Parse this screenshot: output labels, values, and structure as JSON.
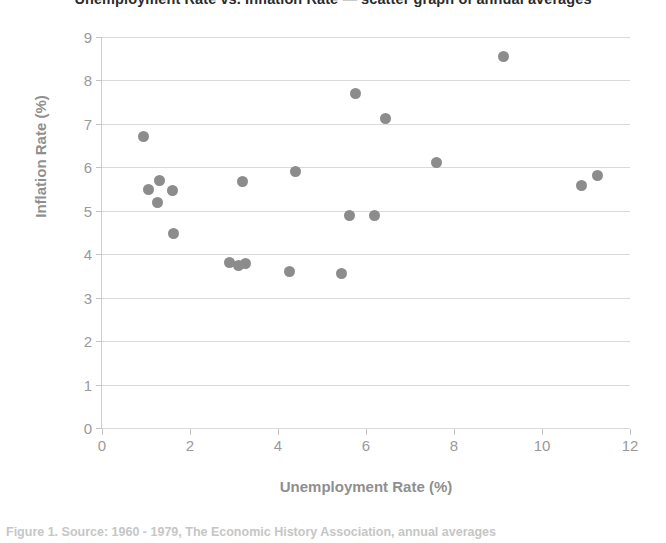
{
  "figure": {
    "title_cropped": "Unemployment Rate vs. Inflation Rate — scatter graph of annual averages",
    "caption_cropped": "Figure 1.  Source: 1960 - 1979, The Economic History Association, annual averages"
  },
  "chart_data": {
    "type": "scatter",
    "title": "",
    "xlabel": "Unemployment Rate (%)",
    "ylabel": "Inflation Rate (%)",
    "xlim": [
      0,
      12
    ],
    "ylim": [
      0,
      9
    ],
    "xticks": [
      0,
      2,
      4,
      6,
      8,
      10,
      12
    ],
    "yticks": [
      0,
      1,
      2,
      3,
      4,
      5,
      6,
      7,
      8,
      9
    ],
    "grid": "horizontal",
    "legend": "none",
    "marker_color": "#8c8c8c",
    "points": [
      {
        "x": 0.95,
        "y": 6.72
      },
      {
        "x": 1.05,
        "y": 5.48
      },
      {
        "x": 1.3,
        "y": 5.7
      },
      {
        "x": 1.25,
        "y": 5.2
      },
      {
        "x": 1.6,
        "y": 5.47
      },
      {
        "x": 1.62,
        "y": 4.48
      },
      {
        "x": 2.9,
        "y": 3.8
      },
      {
        "x": 3.1,
        "y": 3.75
      },
      {
        "x": 3.2,
        "y": 5.67
      },
      {
        "x": 3.25,
        "y": 3.78
      },
      {
        "x": 4.25,
        "y": 3.6
      },
      {
        "x": 4.4,
        "y": 5.9
      },
      {
        "x": 5.45,
        "y": 3.55
      },
      {
        "x": 5.62,
        "y": 4.9
      },
      {
        "x": 5.75,
        "y": 7.7
      },
      {
        "x": 6.2,
        "y": 4.9
      },
      {
        "x": 6.45,
        "y": 7.12
      },
      {
        "x": 7.6,
        "y": 6.12
      },
      {
        "x": 9.12,
        "y": 8.55
      },
      {
        "x": 10.9,
        "y": 5.58
      },
      {
        "x": 11.25,
        "y": 5.82
      }
    ]
  }
}
